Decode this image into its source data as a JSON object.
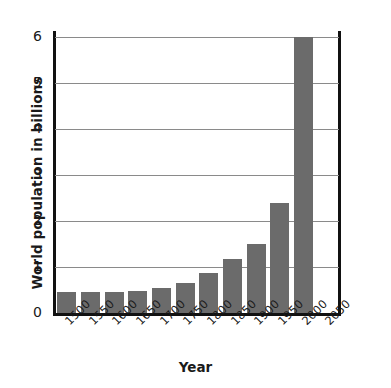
{
  "chart_data": {
    "type": "bar",
    "title": "",
    "xlabel": "Year",
    "ylabel": "World population in billions",
    "categories": [
      "1500",
      "1550",
      "1600",
      "1650",
      "1700",
      "1750",
      "1800",
      "1850",
      "1900",
      "1950",
      "2000",
      "2050"
    ],
    "values": [
      0.46,
      0.46,
      0.46,
      0.47,
      0.55,
      0.65,
      0.87,
      1.17,
      1.49,
      2.4,
      6.0,
      null
    ],
    "ylim": [
      0,
      6
    ],
    "yticks": [
      "0",
      "1",
      "2",
      "3",
      "4",
      "5",
      "6"
    ],
    "ytick_values": [
      0,
      1,
      2,
      3,
      4,
      5,
      6
    ],
    "grid": true,
    "legend": "none",
    "bar_color": "#6b6b6b",
    "grid_color": "#8a8a8a",
    "axis_color": "#111111",
    "background": "#ffffff"
  }
}
